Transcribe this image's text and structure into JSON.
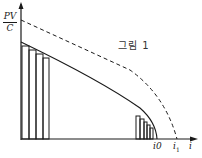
{
  "figure": {
    "caption": "그림 1",
    "y_axis_label_numerator": "PV",
    "y_axis_label_denominator": "C",
    "x_axis_label": "i",
    "x_tick_i0": "i0",
    "x_tick_i1_base": "i",
    "x_tick_i1_sub": "1",
    "curves": [
      {
        "name": "solid-curve",
        "style": "solid",
        "from": "y-axis below PV/C",
        "to": "i0"
      },
      {
        "name": "dashed-line",
        "style": "dashed",
        "from": "PV/C",
        "to": "i1"
      }
    ],
    "bars_left_count": 4,
    "bars_right_count": 5,
    "colors": {
      "ink": "#1a1a1a",
      "background": "#ffffff"
    }
  }
}
